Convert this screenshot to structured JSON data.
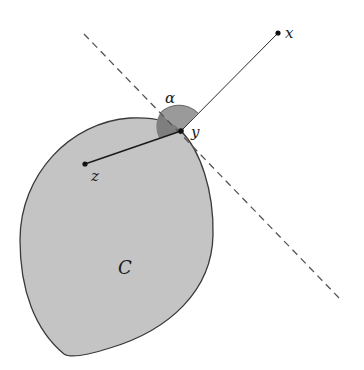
{
  "diagram": {
    "labels": {
      "x": "x",
      "y": "y",
      "z": "z",
      "alpha": "α",
      "set": "C"
    },
    "points": {
      "x": [
        278,
        33
      ],
      "y": [
        181,
        131
      ],
      "z": [
        85,
        164
      ]
    },
    "colors": {
      "set_fill": "#c4c4c4",
      "set_stroke": "#3a3a3a",
      "angle_fill": "#9a9a9a",
      "angle_fill_inner": "#7e7e7e",
      "line": "#2a2a2a",
      "dashed": "#555555"
    }
  }
}
